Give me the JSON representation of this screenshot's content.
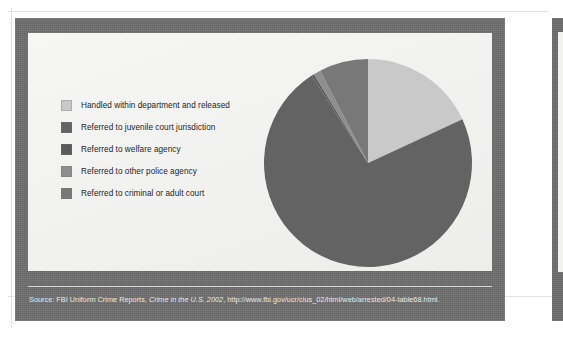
{
  "figure": {
    "frame_color": "#6e6e6e",
    "panel_color": "#f3f3f1"
  },
  "legend": {
    "items": [
      {
        "label": "Handled within department and released",
        "color": "#c9c9c9",
        "swatch_name": "legend-swatch-handled-within-department"
      },
      {
        "label": "Referred to juvenile court jurisdiction",
        "color": "#636363",
        "swatch_name": "legend-swatch-juvenile-court"
      },
      {
        "label": "Referred to welfare agency",
        "color": "#5a5a5a",
        "swatch_name": "legend-swatch-welfare-agency"
      },
      {
        "label": "Referred to other police agency",
        "color": "#8e8e8e",
        "swatch_name": "legend-swatch-other-police-agency"
      },
      {
        "label": "Referred to criminal or adult court",
        "color": "#787878",
        "swatch_name": "legend-swatch-criminal-adult-court"
      }
    ]
  },
  "source": {
    "prefix": "Source: FBI Uniform Crime Reports, ",
    "title": "Crime in the U.S. 2002",
    "suffix": ", http://www.fbi.gov/ucr/cius_02/html/web/arrested/04-table68.html."
  },
  "chart_data": {
    "type": "pie",
    "title": "",
    "subtitle": "",
    "xlabel": "",
    "ylabel": "",
    "legend_position": "left",
    "grid": false,
    "start_angle_deg": 0,
    "direction": "clockwise",
    "center": {
      "cx": 108,
      "cy": 108
    },
    "radius": 104,
    "categories": [
      "Handled within department and released",
      "Referred to juvenile court jurisdiction",
      "Referred to welfare agency",
      "Referred to other police agency",
      "Referred to criminal or adult court"
    ],
    "values": [
      18.1,
      72.8,
      0.4,
      1.1,
      7.6
    ],
    "value_unit": "percent",
    "colors": [
      "#c9c9c9",
      "#636363",
      "#5a5a5a",
      "#8e8e8e",
      "#787878"
    ],
    "slices": [
      {
        "label": "Handled within department and released",
        "value": 18.1,
        "color": "#c9c9c9"
      },
      {
        "label": "Referred to juvenile court jurisdiction",
        "value": 72.8,
        "color": "#636363"
      },
      {
        "label": "Referred to welfare agency",
        "value": 0.4,
        "color": "#5a5a5a"
      },
      {
        "label": "Referred to other police agency",
        "value": 1.1,
        "color": "#8e8e8e"
      },
      {
        "label": "Referred to criminal or adult court",
        "value": 7.6,
        "color": "#787878"
      }
    ]
  }
}
